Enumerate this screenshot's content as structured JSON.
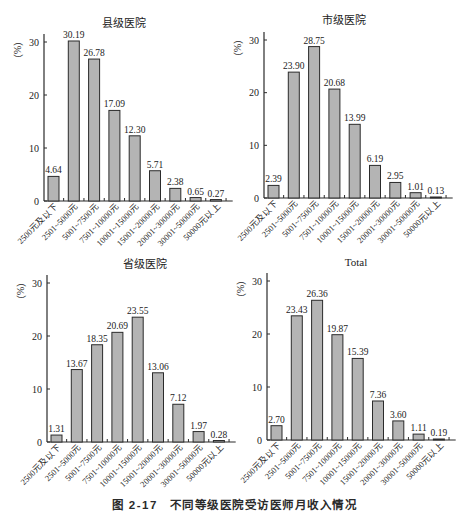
{
  "figure": {
    "caption_number": "图 2-17",
    "caption_text": "不同等级医院受访医师月收入情况"
  },
  "style": {
    "bar_fill": "#b4b4b4",
    "bar_stroke": "#2b2b2b",
    "axis_color": "#2b2b2b",
    "text_color": "#222222"
  },
  "chart_data": [
    {
      "type": "bar",
      "title": "县级医院",
      "xlabel": "",
      "ylabel": "（%）",
      "ylim": [
        0,
        30
      ],
      "yticks": [
        0,
        10,
        20,
        30
      ],
      "grid": false,
      "categories": [
        "2500元及以下",
        "2501~5000元",
        "5001~7500元",
        "7501~10000元",
        "10001~15000元",
        "15001~20000元",
        "20001~30000元",
        "30001~50000元",
        "50000元以上"
      ],
      "values": [
        4.64,
        30.19,
        26.78,
        17.09,
        12.3,
        5.71,
        2.38,
        0.65,
        0.27
      ],
      "value_labels": [
        "4.64",
        "30.19",
        "26.78",
        "17.09",
        "12.30",
        "5.71",
        "2.38",
        "0.65",
        "0.27"
      ]
    },
    {
      "type": "bar",
      "title": "市级医院",
      "xlabel": "",
      "ylabel": "（%）",
      "ylim": [
        0,
        30
      ],
      "yticks": [
        0,
        10,
        20,
        30
      ],
      "grid": false,
      "categories": [
        "2500元及以下",
        "2501~5000元",
        "5001~7500元",
        "7501~10000元",
        "10001~15000元",
        "15001~20000元",
        "20001~30000元",
        "30001~50000元",
        "50000元以上"
      ],
      "values": [
        2.39,
        23.9,
        28.75,
        20.68,
        13.99,
        6.19,
        2.95,
        1.01,
        0.13
      ],
      "value_labels": [
        "2.39",
        "23.90",
        "28.75",
        "20.68",
        "13.99",
        "6.19",
        "2.95",
        "1.01",
        "0.13"
      ]
    },
    {
      "type": "bar",
      "title": "省级医院",
      "xlabel": "",
      "ylabel": "（%）",
      "ylim": [
        0,
        30
      ],
      "yticks": [
        0,
        10,
        20,
        30
      ],
      "grid": false,
      "categories": [
        "2500元及以下",
        "2501~5000元",
        "5001~7500元",
        "7501~10000元",
        "10001~15000元",
        "15001~20000元",
        "20001~30000元",
        "30001~50000元",
        "50000元以上"
      ],
      "values": [
        1.31,
        13.67,
        18.35,
        20.69,
        23.55,
        13.06,
        7.12,
        1.97,
        0.28
      ],
      "value_labels": [
        "1.31",
        "13.67",
        "18.35",
        "20.69",
        "23.55",
        "13.06",
        "7.12",
        "1.97",
        "0.28"
      ]
    },
    {
      "type": "bar",
      "title": "Total",
      "xlabel": "",
      "ylabel": "（%）",
      "ylim": [
        0,
        30
      ],
      "yticks": [
        0,
        10,
        20,
        30
      ],
      "grid": false,
      "categories": [
        "2500元及以下",
        "2501~5000元",
        "5001~7500元",
        "7501~10000元",
        "10001~15000元",
        "15001~20000元",
        "20001~30000元",
        "30001~50000元",
        "50000元以上"
      ],
      "values": [
        2.7,
        23.43,
        26.36,
        19.87,
        15.39,
        7.36,
        3.6,
        1.11,
        0.19
      ],
      "value_labels": [
        "2.70",
        "23.43",
        "26.36",
        "19.87",
        "15.39",
        "7.36",
        "3.60",
        "1.11",
        "0.19"
      ]
    }
  ]
}
